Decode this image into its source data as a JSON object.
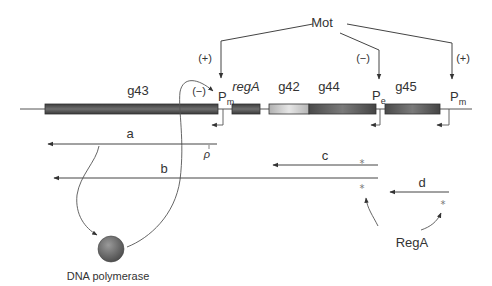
{
  "regulator": {
    "label": "Mot"
  },
  "effects": {
    "pm_left": "(+)",
    "pe": "(−)",
    "pm_right": "(+)",
    "polymerase_on_pm": "(−)"
  },
  "genes": [
    {
      "name": "g43",
      "italic": false
    },
    {
      "name": "regA",
      "italic": true
    },
    {
      "name": "g42",
      "italic": false
    },
    {
      "name": "g44",
      "italic": false
    },
    {
      "name": "g45",
      "italic": false
    }
  ],
  "promoters": [
    {
      "base": "P",
      "sub": "m"
    },
    {
      "base": "P",
      "sub": "e"
    },
    {
      "base": "P",
      "sub": "m"
    }
  ],
  "terminator": {
    "label": "ρ"
  },
  "transcripts": [
    {
      "label": "a"
    },
    {
      "label": "b"
    },
    {
      "label": "c",
      "mark": "*"
    },
    {
      "label": "d"
    }
  ],
  "marks": {
    "star": "*"
  },
  "proteins": {
    "polymerase": "DNA polymerase",
    "rega": "RegA"
  },
  "colors": {
    "dark_gene": "#5a5a5a",
    "light_gene": "#c8c8c8",
    "line": "#444444"
  }
}
